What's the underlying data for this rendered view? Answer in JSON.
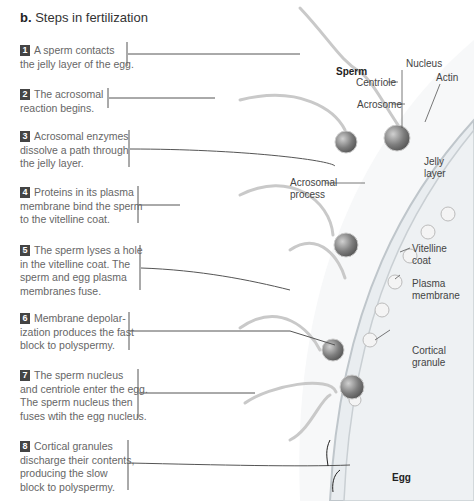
{
  "figure": {
    "panel_label": "b.",
    "title": "Steps in fertilization"
  },
  "steps": [
    {
      "number": "1",
      "text_lines": [
        "A sperm contacts",
        "the jelly layer of the egg."
      ]
    },
    {
      "number": "2",
      "text_lines": [
        "The acrosomal",
        "reaction begins."
      ]
    },
    {
      "number": "3",
      "text_lines": [
        "Acrosomal enzymes",
        "dissolve a path through",
        "the jelly layer."
      ]
    },
    {
      "number": "4",
      "text_lines": [
        "Proteins in its plasma",
        "membrane bind the sperm",
        "to the vitelline coat."
      ]
    },
    {
      "number": "5",
      "text_lines": [
        "The sperm lyses a hole",
        "in the vitelline coat. The",
        "sperm and egg plasma",
        "membranes fuse."
      ]
    },
    {
      "number": "6",
      "text_lines": [
        "Membrane depolar-",
        "ization produces the fast",
        "block to polyspermy."
      ]
    },
    {
      "number": "7",
      "text_lines": [
        "The sperm nucleus",
        "and centriole enter the egg.",
        "The sperm nucleus then",
        "fuses wtih the egg nucleus."
      ]
    },
    {
      "number": "8",
      "text_lines": [
        "Cortical granules",
        "discharge their contents,",
        "producing the slow",
        "block to polyspermy."
      ]
    }
  ],
  "labels": {
    "sperm": "Sperm",
    "nucleus": "Nucleus",
    "centriole": "Centriole",
    "actin": "Actin",
    "acrosome": "Acrosome",
    "jelly_layer": [
      "Jelly",
      "layer"
    ],
    "acrosomal_process": [
      "Acrosomal",
      "process"
    ],
    "vitelline_coat": [
      "Vitelline",
      "coat"
    ],
    "plasma_membrane": [
      "Plasma",
      "membrane"
    ],
    "cortical_granule": [
      "Cortical",
      "granule"
    ],
    "egg": "Egg"
  },
  "colors": {
    "number_badge": "#444444",
    "egg_fill": "#eef1f3",
    "jelly_fill": "#f6f7f8",
    "sperm_head": "#7a7a7a"
  }
}
